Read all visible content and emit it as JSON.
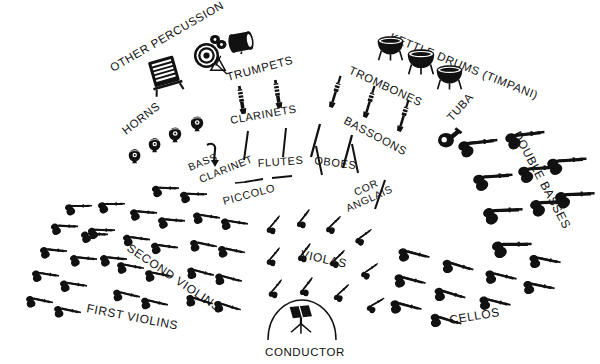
{
  "diagram": {
    "background_color": "#ffffff",
    "ink_color": "#111111",
    "width": 600,
    "height": 364
  },
  "labels": {
    "other_percussion": "OTHER PERCUSSION",
    "kettle_drums": "KETTLE DRUMS (TIMPANI)",
    "trumpets": "TRUMPETS",
    "trombones": "TROMBONES",
    "horns": "HORNS",
    "clarinets": "CLARINETS",
    "bassoons": "BASSOONS",
    "tuba": "TUBA",
    "bass": "BASS",
    "clarinet": "CLARINET",
    "flutes": "FLUTES",
    "oboes": "OBOES",
    "piccolo": "PICCOLO",
    "cor": "COR",
    "anglais": "ANGLAIS",
    "double_basses": "DOUBLE BASSES",
    "violas": "VIOLAS",
    "second_violins": "SECOND VIOLINS",
    "first_violins": "FIRST VIOLINS",
    "cellos": "CELLOS",
    "conductor": "CONDUCTOR"
  },
  "sections": [
    {
      "name": "other-percussion",
      "label": "OTHER PERCUSSION",
      "count": 5,
      "instrument": "percussion",
      "row": "back"
    },
    {
      "name": "kettle-drums",
      "label": "KETTLE DRUMS (TIMPANI)",
      "count": 3,
      "instrument": "timpani",
      "row": "back"
    },
    {
      "name": "horns",
      "label": "HORNS",
      "count": 4,
      "instrument": "french-horn",
      "row": "third"
    },
    {
      "name": "trumpets",
      "label": "TRUMPETS",
      "count": 2,
      "instrument": "trumpet",
      "row": "third"
    },
    {
      "name": "trombones",
      "label": "TROMBONES",
      "count": 3,
      "instrument": "trombone",
      "row": "third"
    },
    {
      "name": "tuba",
      "label": "TUBA",
      "count": 1,
      "instrument": "tuba",
      "row": "third"
    },
    {
      "name": "bass-clarinet",
      "label": "BASS CLARINET",
      "count": 1,
      "instrument": "bass-clarinet",
      "row": "second"
    },
    {
      "name": "clarinets",
      "label": "CLARINETS",
      "count": 2,
      "instrument": "clarinet",
      "row": "second"
    },
    {
      "name": "flutes",
      "label": "FLUTES",
      "count": 2,
      "instrument": "flute",
      "row": "second"
    },
    {
      "name": "piccolo",
      "label": "PICCOLO",
      "count": 1,
      "instrument": "piccolo",
      "row": "second"
    },
    {
      "name": "oboes",
      "label": "OBOES",
      "count": 2,
      "instrument": "oboe",
      "row": "second"
    },
    {
      "name": "cor-anglais",
      "label": "COR ANGLAIS",
      "count": 1,
      "instrument": "cor-anglais",
      "row": "second"
    },
    {
      "name": "first-violins",
      "label": "FIRST VIOLINS",
      "count": 16,
      "instrument": "violin",
      "row": "front-left"
    },
    {
      "name": "second-violins",
      "label": "SECOND VIOLINS",
      "count": 14,
      "instrument": "violin",
      "row": "front-left"
    },
    {
      "name": "violas",
      "label": "VIOLAS",
      "count": 12,
      "instrument": "viola",
      "row": "front-center"
    },
    {
      "name": "cellos",
      "label": "CELLOS",
      "count": 10,
      "instrument": "cello",
      "row": "front-right"
    },
    {
      "name": "double-basses",
      "label": "DOUBLE BASSES",
      "count": 9,
      "instrument": "double-bass",
      "row": "back-right"
    },
    {
      "name": "conductor",
      "label": "CONDUCTOR",
      "count": 1,
      "instrument": "podium",
      "row": "front-center"
    }
  ]
}
